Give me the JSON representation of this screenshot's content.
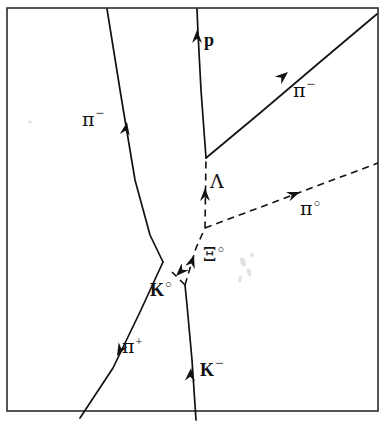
{
  "figure": {
    "kind": "bubble-chamber-event-diagram",
    "background_color": "#ffffff",
    "ink_color": "#111111",
    "frame_color": "#2b2b2b",
    "width": 391,
    "height": 422
  },
  "frame": {
    "x": 7,
    "y": 8,
    "width": 371,
    "height": 403
  },
  "vertices": [
    {
      "id": "primary",
      "label": "primary-interaction-vertex",
      "x": 185,
      "y": 285
    },
    {
      "id": "k0-decay",
      "label": "k-zero-decay-vertex",
      "x": 163,
      "y": 262
    },
    {
      "id": "pi0-branch",
      "label": "pi-zero-branch-point",
      "x": 205,
      "y": 228
    },
    {
      "id": "lambda-decay",
      "label": "lambda-decay-vertex",
      "x": 206,
      "y": 158
    }
  ],
  "tracks": [
    {
      "id": "k-minus",
      "name": "k-minus-track",
      "style": "solid",
      "path": "M 196 420 L 192 360 L 187 305 L 185 285",
      "arrow": {
        "x": 191,
        "y": 368,
        "angle": -85
      }
    },
    {
      "id": "pi-plus",
      "name": "pi-plus-track",
      "style": "solid",
      "path": "M 163 262 L 140 312 L 113 368 L 80 418",
      "arrow": {
        "x": 117,
        "y": 356,
        "angle": 118
      }
    },
    {
      "id": "pi-minus-upper",
      "name": "pi-minus-upper-track",
      "style": "solid",
      "path": "M 107 9 L 121 96 L 135 180 L 150 235 L 163 262",
      "arrow": {
        "x": 127,
        "y": 122,
        "angle": -80
      }
    },
    {
      "id": "k0-dashed",
      "name": "k-zero-neutral-track",
      "style": "dashed",
      "path": "M 185 285 L 172 272",
      "arrow": {
        "x": 176,
        "y": 276,
        "angle": 135
      }
    },
    {
      "id": "xi0-lambda",
      "name": "xi-zero-lambda-neutral-track",
      "style": "dashed",
      "path": "M 185 285 L 196 248 L 205 228 L 206 158",
      "arrow_low": {
        "x": 194,
        "y": 255,
        "angle": -72
      },
      "arrow_high": {
        "x": 205,
        "y": 188,
        "angle": -90
      }
    },
    {
      "id": "pi0",
      "name": "pi-zero-track",
      "style": "dashed",
      "path": "M 205 228 L 378 163",
      "arrow": {
        "x": 300,
        "y": 192,
        "angle": -21
      }
    },
    {
      "id": "proton",
      "name": "proton-track",
      "style": "solid",
      "path": "M 206 158 L 201 90 L 198 33 L 197 9",
      "arrow": {
        "x": 197,
        "y": 30,
        "angle": -90
      }
    },
    {
      "id": "pi-minus-lower",
      "name": "pi-minus-decay-track",
      "style": "solid",
      "path": "M 206 158 L 260 113 L 320 62 L 377 14",
      "arrow": {
        "x": 288,
        "y": 72,
        "angle": -40
      }
    }
  ],
  "labels": [
    {
      "id": "proton",
      "name": "label-proton",
      "base": "p",
      "sup": "",
      "base_style": "roman-bold",
      "x": 204,
      "y": 31
    },
    {
      "id": "pi-minus-upper",
      "name": "label-pi-minus-upper",
      "base": "π",
      "sup": "−",
      "base_style": "greek",
      "x": 82,
      "y": 108
    },
    {
      "id": "pi-minus-decay",
      "name": "label-pi-minus-decay",
      "base": "π",
      "sup": "−",
      "base_style": "greek",
      "x": 293,
      "y": 79
    },
    {
      "id": "lambda",
      "name": "label-lambda",
      "base": "Λ",
      "sup": "",
      "base_style": "greek",
      "x": 210,
      "y": 172
    },
    {
      "id": "pi-zero",
      "name": "label-pi-zero",
      "base": "π",
      "sup": "○",
      "base_style": "greek",
      "x": 300,
      "y": 199
    },
    {
      "id": "xi-zero",
      "name": "label-xi-zero",
      "base": "Ξ",
      "sup": "○",
      "base_style": "greek",
      "x": 203,
      "y": 245
    },
    {
      "id": "k-zero",
      "name": "label-k-zero",
      "base": "K",
      "sup": "○",
      "base_style": "roman-bold",
      "x": 150,
      "y": 281
    },
    {
      "id": "pi-plus",
      "name": "label-pi-plus",
      "base": "π",
      "sup": "+",
      "base_style": "greek",
      "x": 122,
      "y": 337
    },
    {
      "id": "k-minus",
      "name": "label-k-minus",
      "base": "K",
      "sup": "−",
      "base_style": "roman-bold",
      "x": 200,
      "y": 358
    }
  ],
  "smudges": [
    {
      "name": "film-artifact-a",
      "cx": 243,
      "cy": 262,
      "rx": 2.6,
      "ry": 5.0,
      "rot": -20
    },
    {
      "name": "film-artifact-b",
      "cx": 249,
      "cy": 272,
      "rx": 2.0,
      "ry": 4.2,
      "rot": -15
    },
    {
      "name": "film-artifact-c",
      "cx": 240,
      "cy": 279,
      "rx": 1.8,
      "ry": 3.4,
      "rot": 10
    },
    {
      "name": "film-artifact-d",
      "cx": 30,
      "cy": 122,
      "rx": 2.0,
      "ry": 1.6,
      "rot": 0
    },
    {
      "name": "film-artifact-e",
      "cx": 252,
      "cy": 255,
      "rx": 1.6,
      "ry": 2.8,
      "rot": -25
    }
  ]
}
